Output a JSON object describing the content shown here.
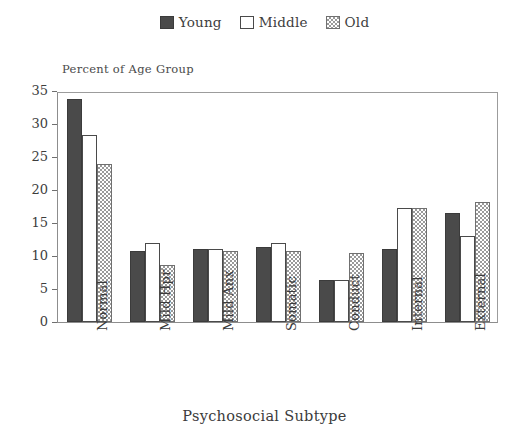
{
  "legend": {
    "position": "top-center",
    "entries": [
      {
        "label": "Young",
        "pattern": "solid",
        "color": "#4a4a4a"
      },
      {
        "label": "Middle",
        "pattern": "empty",
        "color": "#ffffff"
      },
      {
        "label": "Old",
        "pattern": "hatch",
        "color": "#9a9a9a"
      }
    ]
  },
  "chart_data": {
    "type": "bar",
    "title": "",
    "xlabel": "Psychosocial Subtype",
    "ylabel": "Percent of Age Group",
    "ylim": [
      0,
      35
    ],
    "yticks": [
      0,
      5,
      10,
      15,
      20,
      25,
      30,
      35
    ],
    "grid": false,
    "legend_position": "top-center",
    "categories": [
      "Normal",
      "Mild Hpr",
      "Mild Anx",
      "Somatic",
      "Conduct",
      "Internal",
      "External"
    ],
    "series": [
      {
        "name": "Young",
        "values": [
          33.8,
          10.8,
          11.0,
          11.4,
          6.3,
          11.0,
          16.5
        ]
      },
      {
        "name": "Middle",
        "values": [
          28.3,
          12.0,
          11.0,
          12.0,
          6.3,
          17.3,
          13.0
        ]
      },
      {
        "name": "Old",
        "values": [
          24.0,
          8.6,
          10.8,
          10.8,
          10.5,
          17.3,
          18.2
        ]
      }
    ]
  }
}
